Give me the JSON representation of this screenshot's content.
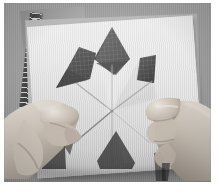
{
  "image": {
    "kind": "photograph",
    "subject": "hands-folding-cut-paper-star",
    "color_mode": "grayscale",
    "width_px": 218,
    "height_px": 193,
    "caption": "",
    "alt_text": "Two hands folding a sheet of white paper with triangular cut-outs forming a six-pointed star pattern, resting on a cutting mat over a gray surface."
  },
  "frame": {
    "border_color": "#ffffff",
    "border_left_px": 4,
    "border_top_px": 3,
    "photo_width_px": 207,
    "photo_height_px": 179
  },
  "palette": {
    "background_gray": "#9a9a9a",
    "paper_white": "#e8e8e8",
    "paper_shadow": "#c2c2c2",
    "cutout_dark": "#4a4a4a",
    "cutout_grid": "#6d6d6d",
    "ruler_dark": "#3a3a3a",
    "mat_gray": "#a4a4a4",
    "skin_light": "#d6cfc6",
    "skin_mid": "#b6aca1",
    "skin_shadow": "#7d7269",
    "crease_line": "#8c8c8c",
    "deep_shadow": "#2e2e2e"
  },
  "scene": {
    "objects": [
      {
        "name": "gray-backdrop",
        "label": "Gray studio backdrop"
      },
      {
        "name": "cutting-mat",
        "label": "Cutting mat"
      },
      {
        "name": "metal-ruler",
        "label": "Metal ruler with tick marks"
      },
      {
        "name": "grid-undersheet",
        "label": "Graph-paper under sheet"
      },
      {
        "name": "white-paper-sheet",
        "label": "White paper sheet"
      },
      {
        "name": "star-cutouts",
        "label": "Triangular star cut-outs"
      },
      {
        "name": "crease-lines",
        "label": "Radiating fold crease lines"
      },
      {
        "name": "left-hand",
        "label": "Left hand pinching fold"
      },
      {
        "name": "right-hand",
        "label": "Right hand holding paper"
      }
    ],
    "cutouts": [
      {
        "name": "cutout-top",
        "label": "Top kite cut-out",
        "shape": "kite"
      },
      {
        "name": "cutout-left",
        "label": "Left wedge cut-out",
        "shape": "wedge"
      },
      {
        "name": "cutout-right",
        "label": "Right wedge cut-out",
        "shape": "wedge"
      },
      {
        "name": "cutout-bottom",
        "label": "Bottom fold shadow",
        "shape": "triangle"
      }
    ],
    "crease_center": {
      "x": 108,
      "y": 108
    },
    "crease_count": 6
  }
}
